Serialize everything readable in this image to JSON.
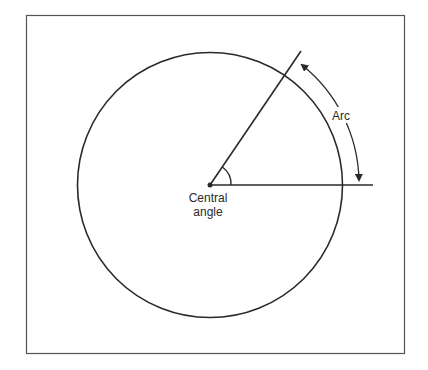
{
  "diagram": {
    "labels": {
      "arc": "Arc",
      "central_angle_line1": "Central",
      "central_angle_line2": "angle"
    },
    "colors": {
      "stroke": "#2a2a2a",
      "frame": "#555555",
      "background": "#ffffff"
    }
  }
}
